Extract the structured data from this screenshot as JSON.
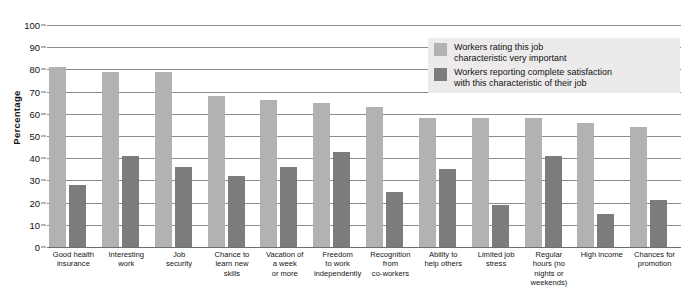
{
  "chart_data": {
    "type": "bar",
    "title": "",
    "xlabel": "",
    "ylabel": "Percentage",
    "ylim": [
      0,
      100
    ],
    "ytick_step": 10,
    "yticks": [
      0,
      10,
      20,
      30,
      40,
      50,
      60,
      70,
      80,
      90,
      100
    ],
    "grid": true,
    "legend_position": "upper-right-inside",
    "categories": [
      "Good health\ninsurance",
      "Interesting\nwork",
      "Job\nsecurity",
      "Chance to\nlearn new\nskills",
      "Vacation of\na week\nor more",
      "Freedom\nto work\nindependently",
      "Recognition\nfrom\nco-workers",
      "Ability to\nhelp others",
      "Limited job\nstress",
      "Regular\nhours (no\nnights or\nweekends)",
      "High income",
      "Chances for\npromotion"
    ],
    "series": [
      {
        "name": "Workers rating this job\ncharacteristic very important",
        "color": "#b2b2b2",
        "values": [
          81,
          79,
          79,
          68,
          66,
          65,
          63,
          58,
          58,
          58,
          56,
          54
        ]
      },
      {
        "name": "Workers reporting complete satisfaction\nwith this characteristic of their job",
        "color": "#7c7c7c",
        "values": [
          28,
          41,
          36,
          32,
          36,
          43,
          25,
          35,
          19,
          41,
          15,
          21
        ]
      }
    ]
  },
  "axis": {
    "y_title": "Percentage"
  },
  "legend": {
    "entries": [
      {
        "label": "Workers rating this job\ncharacteristic very important",
        "color": "#b2b2b2"
      },
      {
        "label": "Workers reporting complete satisfaction\nwith this characteristic of their job",
        "color": "#7c7c7c"
      }
    ]
  },
  "colors": {
    "series_a": "#b2b2b2",
    "series_b": "#7c7c7c",
    "gridline": "#8c8c8c",
    "legend_background": "#eceaea",
    "text": "#111111",
    "page_background": "#ffffff"
  }
}
